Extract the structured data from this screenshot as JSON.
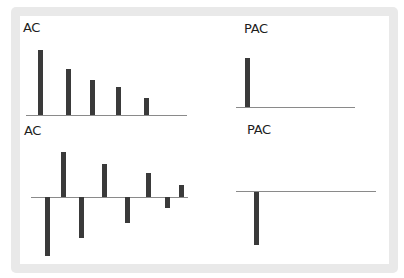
{
  "chart_data": [
    {
      "type": "bar",
      "title": "AC",
      "panel": "top-left",
      "lags": [
        1,
        2,
        3,
        4,
        5
      ],
      "values": [
        1.0,
        0.72,
        0.55,
        0.43,
        0.26
      ],
      "xlabel": "",
      "ylabel": "",
      "grid": false,
      "bars_px": [
        {
          "x": 38,
          "top": 50,
          "bottom": 115
        },
        {
          "x": 66,
          "top": 69,
          "bottom": 115
        },
        {
          "x": 90,
          "top": 80,
          "bottom": 115
        },
        {
          "x": 116,
          "top": 87,
          "bottom": 115
        },
        {
          "x": 144,
          "top": 98,
          "bottom": 115
        }
      ],
      "axis_px": {
        "x1": 26,
        "x2": 187,
        "y": 115
      }
    },
    {
      "type": "bar",
      "title": "PAC",
      "panel": "top-right",
      "lags": [
        1
      ],
      "values": [
        1.0
      ],
      "xlabel": "",
      "ylabel": "",
      "grid": false,
      "bars_px": [
        {
          "x": 245,
          "top": 58,
          "bottom": 107
        }
      ],
      "axis_px": {
        "x1": 236,
        "x2": 355,
        "y": 107
      }
    },
    {
      "type": "bar",
      "title": "AC",
      "panel": "bottom-left",
      "lags": [
        1,
        2,
        3,
        4,
        5,
        6,
        7,
        8
      ],
      "values": [
        -1.0,
        0.78,
        -0.71,
        0.55,
        -0.45,
        0.41,
        -0.19,
        0.2
      ],
      "xlabel": "",
      "ylabel": "",
      "grid": false,
      "bars_px": [
        {
          "x": 45,
          "top": 197,
          "bottom": 256
        },
        {
          "x": 61,
          "top": 152,
          "bottom": 197
        },
        {
          "x": 79,
          "top": 197,
          "bottom": 238
        },
        {
          "x": 102,
          "top": 164,
          "bottom": 197
        },
        {
          "x": 125,
          "top": 197,
          "bottom": 223
        },
        {
          "x": 146,
          "top": 173,
          "bottom": 197
        },
        {
          "x": 165,
          "top": 197,
          "bottom": 208
        },
        {
          "x": 179,
          "top": 185,
          "bottom": 197
        }
      ],
      "axis_px": {
        "x1": 31,
        "x2": 188,
        "y": 197
      }
    },
    {
      "type": "bar",
      "title": "PAC",
      "panel": "bottom-right",
      "lags": [
        1
      ],
      "values": [
        -1.0
      ],
      "xlabel": "",
      "ylabel": "",
      "grid": false,
      "bars_px": [
        {
          "x": 254,
          "top": 192,
          "bottom": 245
        }
      ],
      "axis_px": {
        "x1": 236,
        "x2": 376,
        "y": 191
      }
    }
  ],
  "labels": {
    "top_left": "AC",
    "top_right": "PAC",
    "bottom_left": "AC",
    "bottom_right": "PAC"
  },
  "colors": {
    "bar": "#3a3a3a",
    "axis": "#8a8a8a",
    "frame": "#e9e9e9",
    "background": "#ffffff"
  }
}
